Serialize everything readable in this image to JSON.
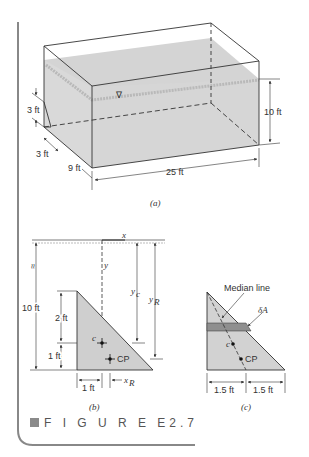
{
  "figure": {
    "caption": "F I G U R E  E2.7",
    "caption_marker_color": "#8a8a8a",
    "accent_border_color": "#888888",
    "water_color": "#d4d4d4",
    "plate_color": "#cfcfcf",
    "strip_color": "#8f8f8f"
  },
  "panel_a": {
    "label": "(a)",
    "dims": {
      "gate_height": "3 ft",
      "gate_width": "3 ft",
      "depth": "9 ft",
      "length": "25 ft",
      "water_depth": "10 ft"
    },
    "free_surface_symbol": "∇"
  },
  "panel_b": {
    "label": "(b)",
    "axis_x": "x",
    "axis_y": "y",
    "break_symbol": "≈",
    "dims": {
      "total_depth": "10 ft",
      "upper": "2 ft",
      "lower": "1 ft",
      "base": "1 ft",
      "yc": "y",
      "yc_sub": "c",
      "yR": "y",
      "yR_sub": "R",
      "xR": "x",
      "xR_sub": "R"
    },
    "centroid_label": "c",
    "cp_label": "CP"
  },
  "panel_c": {
    "label": "(c)",
    "median_label": "Median line",
    "dA_label": "δA",
    "centroid_label": "c",
    "cp_label": "CP",
    "dims": {
      "left": "1.5 ft",
      "right": "1.5 ft"
    }
  }
}
